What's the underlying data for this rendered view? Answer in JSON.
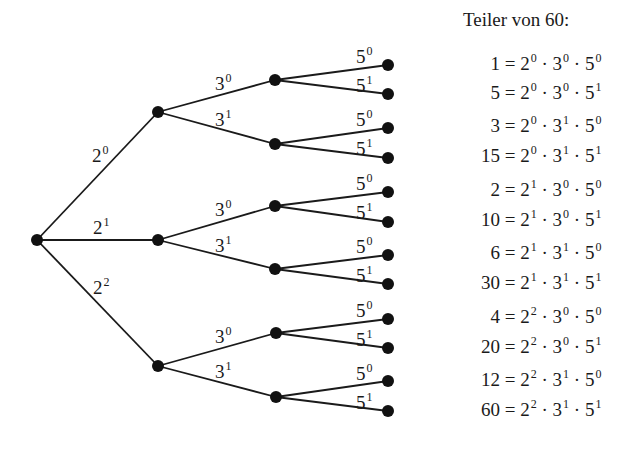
{
  "heading": "Teiler von 60:",
  "tree": {
    "level1_labels": [
      {
        "base": "2",
        "exp": "0"
      },
      {
        "base": "2",
        "exp": "1"
      },
      {
        "base": "2",
        "exp": "2"
      }
    ],
    "level2_labels": [
      {
        "base": "3",
        "exp": "0"
      },
      {
        "base": "3",
        "exp": "1"
      },
      {
        "base": "3",
        "exp": "0"
      },
      {
        "base": "3",
        "exp": "1"
      },
      {
        "base": "3",
        "exp": "0"
      },
      {
        "base": "3",
        "exp": "1"
      }
    ],
    "level3_labels": [
      {
        "base": "5",
        "exp": "0"
      },
      {
        "base": "5",
        "exp": "1"
      },
      {
        "base": "5",
        "exp": "0"
      },
      {
        "base": "5",
        "exp": "1"
      },
      {
        "base": "5",
        "exp": "0"
      },
      {
        "base": "5",
        "exp": "1"
      },
      {
        "base": "5",
        "exp": "0"
      },
      {
        "base": "5",
        "exp": "1"
      },
      {
        "base": "5",
        "exp": "0"
      },
      {
        "base": "5",
        "exp": "1"
      },
      {
        "base": "5",
        "exp": "0"
      },
      {
        "base": "5",
        "exp": "1"
      }
    ]
  },
  "divisors": [
    {
      "value": "1",
      "a": "0",
      "b": "0",
      "c": "0"
    },
    {
      "value": "5",
      "a": "0",
      "b": "0",
      "c": "1"
    },
    {
      "value": "3",
      "a": "0",
      "b": "1",
      "c": "0"
    },
    {
      "value": "15",
      "a": "0",
      "b": "1",
      "c": "1"
    },
    {
      "value": "2",
      "a": "1",
      "b": "0",
      "c": "0"
    },
    {
      "value": "10",
      "a": "1",
      "b": "0",
      "c": "1"
    },
    {
      "value": "6",
      "a": "1",
      "b": "1",
      "c": "0"
    },
    {
      "value": "30",
      "a": "1",
      "b": "1",
      "c": "1"
    },
    {
      "value": "4",
      "a": "2",
      "b": "0",
      "c": "0"
    },
    {
      "value": "20",
      "a": "2",
      "b": "0",
      "c": "1"
    },
    {
      "value": "12",
      "a": "2",
      "b": "1",
      "c": "0"
    },
    {
      "value": "60",
      "a": "2",
      "b": "1",
      "c": "1"
    }
  ],
  "symbols": {
    "equals": "=",
    "dot": "·",
    "base2": "2",
    "base3": "3",
    "base5": "5"
  }
}
